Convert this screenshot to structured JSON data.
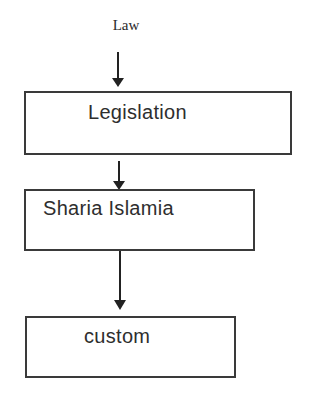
{
  "diagram": {
    "type": "flowchart",
    "direction": "top-to-bottom",
    "title": "Law",
    "nodes": [
      {
        "id": "legislation",
        "label": "Legislation"
      },
      {
        "id": "sharia",
        "label": "Sharia Islamia"
      },
      {
        "id": "custom",
        "label": "custom"
      }
    ],
    "edges": [
      {
        "from": "Law",
        "to": "legislation"
      },
      {
        "from": "legislation",
        "to": "sharia"
      },
      {
        "from": "sharia",
        "to": "custom"
      }
    ],
    "colors": {
      "stroke": "#222222",
      "text": "#2e2e2e",
      "background": "#ffffff"
    }
  }
}
